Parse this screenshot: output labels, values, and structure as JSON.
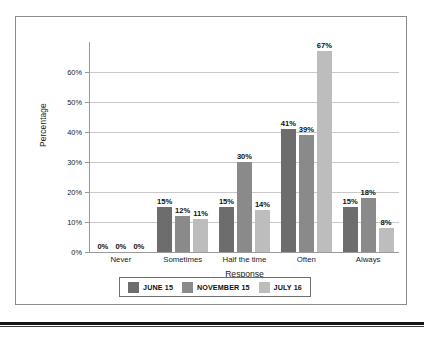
{
  "chart_data": {
    "type": "bar",
    "title": "",
    "xlabel": "Response",
    "ylabel": "Percentage",
    "categories": [
      "Never",
      "Sometimes",
      "Half the time",
      "Often",
      "Always"
    ],
    "series": [
      {
        "name": "JUNE 15",
        "color": "#6d6d6d",
        "values": [
          0,
          15,
          15,
          41,
          15
        ]
      },
      {
        "name": "NOVEMBER 15",
        "color": "#8a8a8a",
        "values": [
          0,
          12,
          30,
          39,
          18
        ]
      },
      {
        "name": "JULY 16",
        "color": "#bdbdbd",
        "values": [
          0,
          11,
          14,
          67,
          8
        ]
      }
    ],
    "value_labels": [
      [
        "0%",
        "0%",
        "0%"
      ],
      [
        "15%",
        "12%",
        "11%"
      ],
      [
        "15%",
        "30%",
        "14%"
      ],
      [
        "41%",
        "39%",
        "67%"
      ],
      [
        "15%",
        "18%",
        "8%"
      ]
    ],
    "ylim": [
      0,
      70
    ],
    "y_ticks": [
      0,
      10,
      20,
      30,
      40,
      50,
      60
    ],
    "y_tick_labels": [
      "0%",
      "10%",
      "20%",
      "30%",
      "40%",
      "50%",
      "60%"
    ],
    "grid": true,
    "legend_position": "bottom"
  },
  "axes": {
    "y_title": "Percentage",
    "x_title": "Response"
  },
  "legend": {
    "items": [
      {
        "label": "JUNE 15",
        "color": "#6d6d6d"
      },
      {
        "label": "NOVEMBER 15",
        "color": "#8a8a8a"
      },
      {
        "label": "JULY 16",
        "color": "#bdbdbd"
      }
    ]
  },
  "colors": {
    "frame": "#8c8c8c",
    "gridline": "#c9c9c9",
    "axis": "#9a9a9a",
    "text": "#1a1a1a",
    "page_rule": "#151515"
  }
}
